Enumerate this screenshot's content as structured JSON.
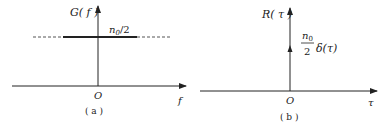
{
  "panels": [
    {
      "id": "a",
      "caption": "( a )",
      "y_axis_label": "G( f )",
      "x_axis_label": "f",
      "origin_label": "O",
      "level_label": "n",
      "level_label_sub": "0",
      "level_label_tail": "/2",
      "description": "Flat power spectral density of white noise at level n0/2, extending infinitely (dashed)"
    },
    {
      "id": "b",
      "caption": "( b )",
      "y_axis_label": "R( τ )",
      "x_axis_label": "τ",
      "origin_label": "O",
      "impulse_num": "n",
      "impulse_num_sub": "0",
      "impulse_den": "2",
      "impulse_fn": "δ(τ)",
      "description": "Autocorrelation of white noise: impulse (n0/2)δ(τ) at origin"
    }
  ],
  "colors": {
    "stroke": "#222222",
    "dashed": "#555555"
  }
}
